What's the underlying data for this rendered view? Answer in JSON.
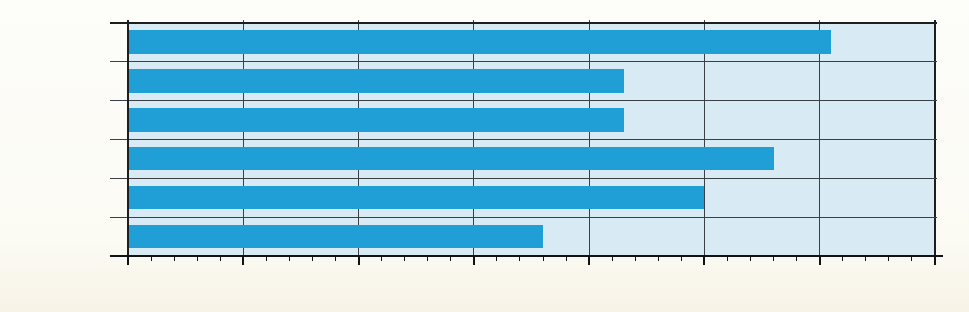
{
  "chart_data": {
    "type": "bar",
    "orientation": "horizontal",
    "title": "",
    "xlabel": "",
    "ylabel": "",
    "categories": [
      "1990",
      "1989",
      "1988",
      "1987",
      "1986",
      "1985"
    ],
    "values": [
      61,
      43,
      43,
      56,
      50,
      36
    ],
    "value_labels": [
      "61 %",
      "43 %",
      "43 %",
      "56 %",
      "50 %",
      "36 %"
    ],
    "xlim": [
      0,
      70
    ],
    "x_major_ticks": [
      0,
      10,
      20,
      30,
      40,
      50,
      60,
      70
    ],
    "x_major_tick_labels": [
      "0",
      "10",
      "20",
      "30",
      "40",
      "50",
      "60",
      "70"
    ],
    "x_minor_tick_step": 2,
    "legend": null,
    "grid": {
      "vertical_major_gridlines": true,
      "horizontal_row_separators": true,
      "minor_ticks_bottom_only": true
    },
    "colors": {
      "bar": "#1f9fd6",
      "plot_background": "#d8eaf3",
      "page_background": "#fbfaf3",
      "grid_line": "#3a4045",
      "border_line": "#1c1e1f",
      "axis_line": "#111213",
      "text": "#151515"
    }
  }
}
